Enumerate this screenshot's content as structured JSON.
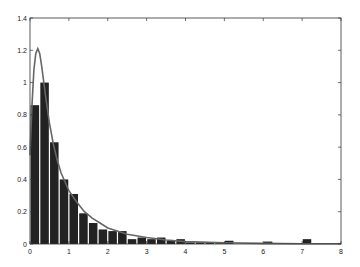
{
  "chart_data": {
    "type": "bar",
    "title": "",
    "xlabel": "",
    "ylabel": "",
    "xlim": [
      0,
      8
    ],
    "ylim": [
      0,
      1.4
    ],
    "grid": false,
    "bin_width": 0.25,
    "x_ticks": [
      "0",
      "1",
      "2",
      "3",
      "4",
      "5",
      "6",
      "7",
      "8"
    ],
    "y_ticks": [
      "0",
      "0.2",
      "0.4",
      "0.6",
      "0.8",
      "1",
      "1.2",
      "1.4"
    ],
    "series": [
      {
        "name": "histogram",
        "type": "bar",
        "color": "#222222",
        "bins_left": [
          0,
          0.25,
          0.5,
          0.75,
          1.0,
          1.25,
          1.5,
          1.75,
          2.0,
          2.25,
          2.5,
          2.75,
          3.0,
          3.25,
          3.5,
          3.75,
          4.0,
          4.25,
          4.5,
          4.75,
          5.0,
          6.0,
          7.0
        ],
        "values": [
          0.86,
          1.0,
          0.63,
          0.4,
          0.31,
          0.19,
          0.13,
          0.09,
          0.08,
          0.08,
          0.03,
          0.04,
          0.03,
          0.04,
          0.02,
          0.03,
          0.01,
          0.01,
          0.01,
          0.005,
          0.02,
          0.015,
          0.03
        ]
      },
      {
        "name": "fitted density",
        "type": "line",
        "color": "#666666",
        "x": [
          0,
          0.05,
          0.1,
          0.15,
          0.2,
          0.25,
          0.3,
          0.4,
          0.5,
          0.6,
          0.7,
          0.8,
          1.0,
          1.2,
          1.4,
          1.6,
          1.8,
          2.0,
          2.5,
          3.0,
          3.5,
          4.0,
          5.0,
          6.0,
          7.0,
          8.0
        ],
        "y": [
          0.55,
          0.85,
          1.08,
          1.18,
          1.21,
          1.18,
          1.1,
          0.92,
          0.75,
          0.62,
          0.52,
          0.44,
          0.33,
          0.26,
          0.2,
          0.16,
          0.13,
          0.1,
          0.06,
          0.04,
          0.025,
          0.015,
          0.008,
          0.004,
          0.002,
          0.001
        ]
      }
    ]
  }
}
